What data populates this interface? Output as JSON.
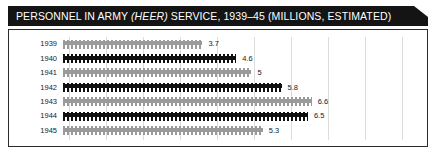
{
  "header": {
    "title_pre": "PERSONNEL IN ARMY ",
    "title_italic": "(HEER)",
    "title_post": " SERVICE, 1939–45 (MILLIONS, ESTIMATED)",
    "background_color": "#141414",
    "text_color": "#ffffff"
  },
  "chart_data": {
    "type": "bar",
    "orientation": "horizontal",
    "title": "PERSONNEL IN ARMY (HEER) SERVICE, 1939–45 (MILLIONS, ESTIMATED)",
    "xlabel": "",
    "ylabel": "",
    "unit": "millions",
    "categories": [
      "1939",
      "1940",
      "1941",
      "1942",
      "1943",
      "1944",
      "1945"
    ],
    "values": [
      3.7,
      4.6,
      5,
      5.8,
      6.6,
      6.5,
      5.3
    ],
    "value_labels": [
      "3.7",
      "4.6",
      "5",
      "5.8",
      "6.6",
      "6.5",
      "5.3"
    ],
    "bar_styles": [
      "gray",
      "black",
      "gray",
      "black",
      "gray",
      "black",
      "gray"
    ],
    "bar_colors": {
      "gray": "#9a9a9a",
      "black": "#0f0f0f"
    },
    "pictogram": true,
    "xlim": [
      0,
      9.5
    ],
    "grid": true,
    "gridline_color": "#dcdcdc",
    "gridline_values": [
      0,
      1,
      2,
      3,
      4,
      5,
      6,
      7,
      8,
      9
    ],
    "legend": null,
    "rows": [
      {
        "year": "1939",
        "value": 3.7,
        "label": "3.7",
        "style": "gray"
      },
      {
        "year": "1940",
        "value": 4.6,
        "label": "4.6",
        "style": "black"
      },
      {
        "year": "1941",
        "value": 5,
        "label": "5",
        "style": "gray"
      },
      {
        "year": "1942",
        "value": 5.8,
        "label": "5.8",
        "style": "black"
      },
      {
        "year": "1943",
        "value": 6.6,
        "label": "6.6",
        "style": "gray"
      },
      {
        "year": "1944",
        "value": 6.5,
        "label": "6.5",
        "style": "black"
      },
      {
        "year": "1945",
        "value": 5.3,
        "label": "5.3",
        "style": "gray"
      }
    ]
  }
}
